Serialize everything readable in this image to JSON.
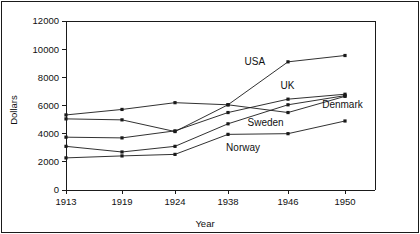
{
  "chart_data": {
    "type": "line",
    "title": "",
    "xlabel": "Year",
    "ylabel": "Dollars",
    "x": [
      1913,
      1919,
      1924,
      1938,
      1946,
      1950
    ],
    "xtick_labels": [
      "1913",
      "1919",
      "1924",
      "1938",
      "1946",
      "1950"
    ],
    "ytick_labels": [
      "0",
      "2000",
      "4000",
      "6000",
      "8000",
      "10000",
      "12000"
    ],
    "yticks": [
      0,
      2000,
      4000,
      6000,
      8000,
      10000,
      12000
    ],
    "ylim": [
      0,
      12000
    ],
    "grid": false,
    "legend_position": "inline-annotations",
    "marker": "square",
    "line_color": "#1a1a1a",
    "series": [
      {
        "name": "USA",
        "values": [
          5050,
          4980,
          4150,
          6050,
          9100,
          9550
        ],
        "label": "USA",
        "label_x": 1940.2,
        "label_y": 8850
      },
      {
        "name": "UK",
        "values": [
          3750,
          3700,
          4200,
          5500,
          6450,
          6800
        ],
        "label": "UK",
        "label_x": 1945.0,
        "label_y": 7150
      },
      {
        "name": "Denmark",
        "values": [
          5330,
          5720,
          6200,
          6050,
          5500,
          6650
        ],
        "label": "Denmark",
        "label_x": 1948.4,
        "label_y": 5850
      },
      {
        "name": "Sweden",
        "values": [
          3100,
          2700,
          3100,
          4700,
          6050,
          6700
        ],
        "label": "Sweden",
        "label_x": 1940.6,
        "label_y": 4550
      },
      {
        "name": "Norway",
        "values": [
          2280,
          2420,
          2530,
          3950,
          4000,
          4900
        ],
        "label": "Norway",
        "label_x": 1937.5,
        "label_y": 2750
      }
    ]
  }
}
